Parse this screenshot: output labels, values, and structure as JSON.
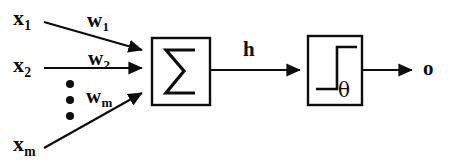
{
  "diagram": {
    "colors": {
      "ink": "#0d0d0d",
      "background": "#ffffff"
    },
    "inputs": [
      {
        "id": "x1",
        "base": "x",
        "subscript": "1"
      },
      {
        "id": "x2",
        "base": "x",
        "subscript": "2"
      },
      {
        "id": "xm",
        "base": "x",
        "subscript": "m"
      }
    ],
    "weights": [
      {
        "id": "w1",
        "base": "w",
        "subscript": "1"
      },
      {
        "id": "w2",
        "base": "w",
        "subscript": "2"
      },
      {
        "id": "wm",
        "base": "w",
        "subscript": "m"
      }
    ],
    "ellipsis": {
      "name": "vertical-ellipsis",
      "dot_count": 3
    },
    "blocks": [
      {
        "id": "summation",
        "symbol": "∑",
        "label": "summation-block"
      },
      {
        "id": "activation",
        "symbol": "step-function",
        "label": "threshold-activation-block",
        "threshold_symbol": "θ"
      }
    ],
    "signals": {
      "hidden": "h",
      "output": "o"
    }
  }
}
